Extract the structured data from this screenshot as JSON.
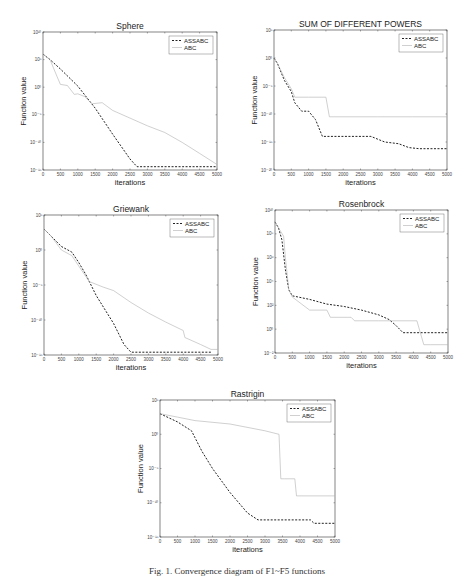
{
  "caption": "Fig. 1. Convergence diagram of F1~F5 functions",
  "chart_data": [
    {
      "id": "sphere",
      "type": "line",
      "title": "Sphere",
      "xlabel": "iterations",
      "ylabel": "Function value",
      "yscale": "log",
      "xlim": [
        0,
        5000
      ],
      "ylim_exp": [
        -15,
        10
      ],
      "x_ticks": [
        0,
        500,
        1000,
        1500,
        2000,
        2500,
        3000,
        3500,
        4000,
        4500,
        5000
      ],
      "y_ticks_exp": [
        10,
        5,
        0,
        -5,
        -10,
        -15
      ],
      "legend": [
        "ASSABC",
        "ABC"
      ],
      "legend_position": "upper right",
      "box": [
        43,
        32,
        217,
        170
      ],
      "series": [
        {
          "name": "ASSABC",
          "style": "dashed",
          "x": [
            0,
            200,
            500,
            1000,
            1500,
            2000,
            2500,
            2700,
            3000,
            4000,
            5000
          ],
          "y_exp": [
            6,
            5,
            3.3,
            0.2,
            -3.8,
            -8.5,
            -13,
            -14.4,
            -14.4,
            -14.4,
            -14.4
          ]
        },
        {
          "name": "ABC",
          "style": "solid",
          "x": [
            0,
            200,
            400,
            500,
            700,
            900,
            1000,
            1200,
            1400,
            1700,
            2000,
            2500,
            3000,
            3500,
            4000,
            4500,
            5000
          ],
          "y_exp": [
            6,
            5,
            2,
            0.5,
            0.3,
            -1.3,
            -1.2,
            -1.7,
            -3,
            -2.8,
            -4.2,
            -5.6,
            -7,
            -8.2,
            -10,
            -12,
            -14
          ]
        }
      ]
    },
    {
      "id": "sum-of-different-powers",
      "type": "line",
      "title": "SUM OF DIFFERENT POWERS",
      "xlabel": "iterations",
      "ylabel": "Function value",
      "yscale": "log",
      "xlim": [
        0,
        5000
      ],
      "ylim_exp": [
        -20,
        5
      ],
      "x_ticks": [
        0,
        500,
        1000,
        1500,
        2000,
        2500,
        3000,
        3500,
        4000,
        4500,
        5000
      ],
      "y_ticks_exp": [
        5,
        0,
        -5,
        -10,
        -15,
        -20
      ],
      "legend": [
        "ASSABC",
        "ABC"
      ],
      "legend_position": "upper right",
      "box": [
        274,
        30,
        447,
        170
      ],
      "series": [
        {
          "name": "ASSABC",
          "style": "dashed",
          "x": [
            0,
            100,
            300,
            500,
            600,
            800,
            1000,
            1200,
            1400,
            2000,
            2800,
            3200,
            3600,
            3900,
            4200,
            5000
          ],
          "y_exp": [
            0,
            -1,
            -4,
            -6,
            -8,
            -9.5,
            -9.5,
            -11,
            -14,
            -14,
            -14,
            -15,
            -15.3,
            -16,
            -16.2,
            -16.2
          ]
        },
        {
          "name": "ABC",
          "style": "solid",
          "x": [
            0,
            100,
            300,
            500,
            600,
            1000,
            1500,
            1600,
            2000,
            3000,
            4000,
            5000
          ],
          "y_exp": [
            0,
            -1,
            -3.5,
            -5.5,
            -7,
            -7,
            -7,
            -10.5,
            -10.5,
            -10.5,
            -10.5,
            -10.5
          ]
        }
      ]
    },
    {
      "id": "griewank",
      "type": "line",
      "title": "Griewank",
      "xlabel": "iterations",
      "ylabel": "Function value",
      "yscale": "log",
      "xlim": [
        0,
        5000
      ],
      "ylim_exp": [
        -15,
        5
      ],
      "x_ticks": [
        0,
        500,
        1000,
        1500,
        2000,
        2500,
        3000,
        3500,
        4000,
        4500,
        5000
      ],
      "y_ticks_exp": [
        5,
        0,
        -5,
        -10,
        -15
      ],
      "legend": [
        "ASSABC",
        "ABC"
      ],
      "legend_position": "upper right",
      "box": [
        44,
        215,
        218,
        355
      ],
      "series": [
        {
          "name": "ASSABC",
          "style": "dashed",
          "x": [
            0,
            200,
            500,
            800,
            1000,
            1200,
            1500,
            2000,
            2300,
            2500,
            3000,
            4000,
            4800
          ],
          "y_exp": [
            3,
            2,
            0.5,
            -0.3,
            -1.8,
            -3.5,
            -6.5,
            -10.5,
            -13.5,
            -14.6,
            -14.6,
            -14.6,
            -14.6
          ]
        },
        {
          "name": "ABC",
          "style": "solid",
          "x": [
            0,
            200,
            500,
            800,
            1000,
            1300,
            1700,
            2000,
            2500,
            3000,
            3500,
            4000,
            4050,
            4500,
            4800,
            5000
          ],
          "y_exp": [
            3,
            2,
            0,
            -0.8,
            -2.3,
            -4.5,
            -5.3,
            -5.8,
            -7.5,
            -9,
            -10.3,
            -11.5,
            -12.5,
            -13.5,
            -14.2,
            -14.2
          ]
        }
      ]
    },
    {
      "id": "rosenbrock",
      "type": "line",
      "title": "Rosenbrock",
      "xlabel": "iterations",
      "ylabel": "Function value",
      "yscale": "log",
      "xlim": [
        0,
        5000
      ],
      "ylim_exp": [
        -2,
        10
      ],
      "x_ticks": [
        0,
        500,
        1000,
        1500,
        2000,
        2500,
        3000,
        3500,
        4000,
        4500,
        5000
      ],
      "y_ticks_exp": [
        10,
        8,
        6,
        4,
        2,
        0,
        -2
      ],
      "legend": [
        "ASSABC",
        "ABC"
      ],
      "legend_position": "upper right",
      "box": [
        275,
        210,
        448,
        353
      ],
      "series": [
        {
          "name": "ASSABC",
          "style": "dashed",
          "x": [
            0,
            100,
            200,
            300,
            400,
            500,
            1000,
            1500,
            2000,
            2500,
            3000,
            3300,
            3500,
            3700,
            4000,
            5000
          ],
          "y_exp": [
            9,
            8.5,
            7.5,
            5,
            3.3,
            2.8,
            2.5,
            2.1,
            1.9,
            1.6,
            1.2,
            0.8,
            0.3,
            -0.3,
            -0.3,
            -0.3
          ]
        },
        {
          "name": "ABC",
          "style": "solid",
          "x": [
            0,
            100,
            250,
            300,
            400,
            500,
            1000,
            1500,
            1600,
            2200,
            2300,
            3000,
            3500,
            4100,
            4200,
            4300,
            4500,
            5000
          ],
          "y_exp": [
            9,
            8.5,
            7.8,
            6,
            3.3,
            2.7,
            1.6,
            1.6,
            1.0,
            1.0,
            0.7,
            0.7,
            0.7,
            0.7,
            -0.3,
            -1.3,
            -1.3,
            -1.3
          ]
        }
      ]
    },
    {
      "id": "rastrigin",
      "type": "line",
      "title": "Rastrigin",
      "xlabel": "iterations",
      "ylabel": "Function value",
      "yscale": "log",
      "xlim": [
        0,
        5000
      ],
      "ylim_exp": [
        -15,
        5
      ],
      "x_ticks": [
        0,
        500,
        1000,
        1500,
        2000,
        2500,
        3000,
        3500,
        4000,
        4500,
        5000
      ],
      "y_ticks_exp": [
        5,
        0,
        -5,
        -10,
        -15
      ],
      "legend": [
        "ASSABC",
        "ABC"
      ],
      "legend_position": "upper right",
      "box": [
        160,
        400,
        335,
        537
      ],
      "series": [
        {
          "name": "ASSABC",
          "style": "dashed",
          "x": [
            0,
            500,
            900,
            1000,
            1200,
            1500,
            2000,
            2500,
            2800,
            3000,
            4000,
            4300,
            4400,
            5000
          ],
          "y_exp": [
            3,
            1.8,
            0.5,
            -0.5,
            -2.5,
            -5,
            -8.5,
            -11.5,
            -12.5,
            -12.5,
            -12.5,
            -12.5,
            -13,
            -13
          ]
        },
        {
          "name": "ABC",
          "style": "solid",
          "x": [
            0,
            500,
            1000,
            2000,
            3000,
            3400,
            3450,
            3550,
            3850,
            3900,
            4000,
            5000
          ],
          "y_exp": [
            3,
            2.5,
            2,
            1.5,
            0.5,
            0,
            -6.5,
            -6.5,
            -6.5,
            -9,
            -9,
            -9
          ]
        }
      ]
    }
  ]
}
